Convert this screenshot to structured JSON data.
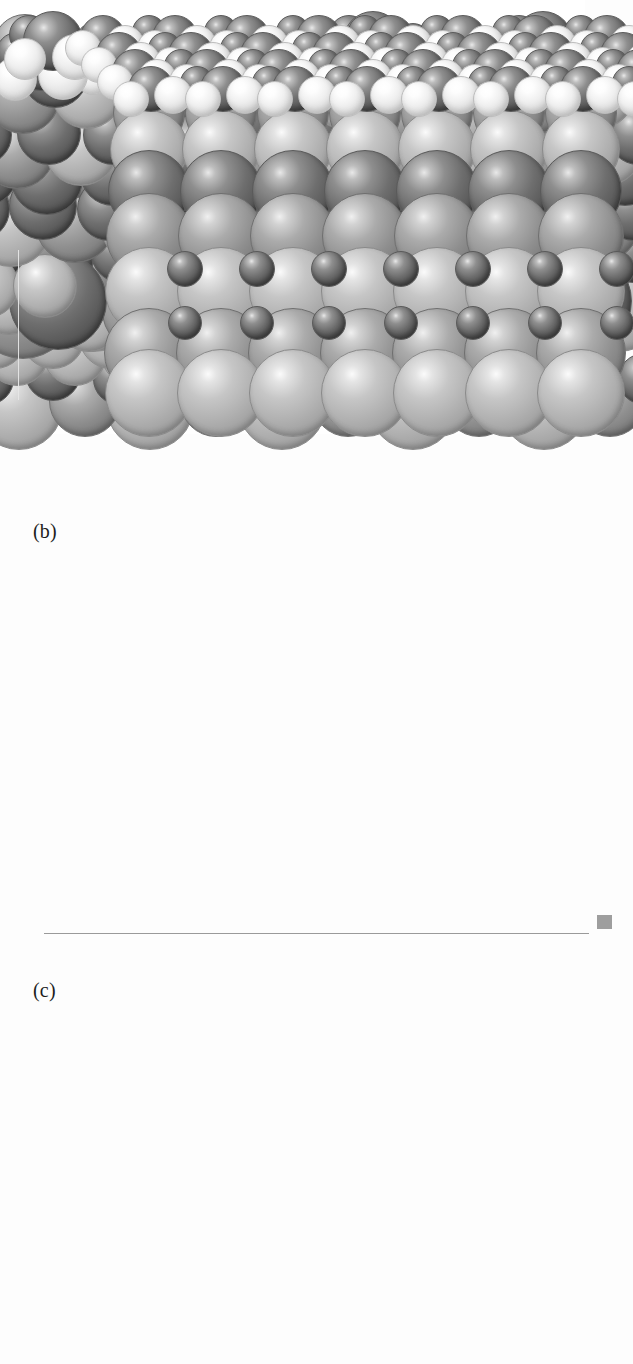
{
  "figure": {
    "type": "space-filling-molecular-model-figure",
    "background_color": "#ffffff",
    "panels": [
      {
        "id": "a",
        "label": "(a)",
        "view": "side-view",
        "rows": 5,
        "repeat_units": 4,
        "has_unit_cell_box": false
      },
      {
        "id": "b",
        "label": "(b)",
        "view": "perspective-3d",
        "rows": 6,
        "repeat_units": 6,
        "has_unit_cell_box": true
      },
      {
        "id": "c",
        "label": "(c)",
        "view": "tilted-side-view",
        "rows": 3,
        "repeat_units": 4,
        "has_unit_cell_box": false
      }
    ],
    "atom_species": [
      {
        "name": "dark-sphere",
        "role": "carbon-or-oxygen",
        "color": "#6e6e6e"
      },
      {
        "name": "mid-sphere",
        "role": "metal-sublattice",
        "color": "#8f8f8f"
      },
      {
        "name": "light-sphere",
        "role": "metal-cation",
        "color": "#b0b0b0"
      },
      {
        "name": "white-sphere",
        "role": "hydrogen",
        "color": "#f5f5f5"
      }
    ],
    "colors": {
      "dark": "#6e6e6e",
      "mid": "#8f8f8f",
      "light": "#b0b0b0",
      "white": "#f5f5f5",
      "highlight": "#ffffff",
      "baseline": "#9a9a9a",
      "cell_line": "#e6e6e6",
      "label_text": "#1d1d1d"
    }
  }
}
